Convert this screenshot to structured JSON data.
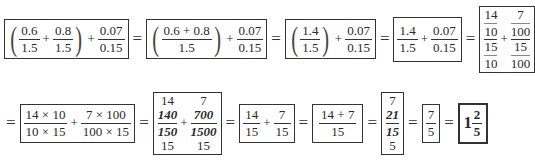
{
  "row1": {
    "step1": {
      "a_num": "0.6",
      "a_den": "1.5",
      "op1": "+",
      "b_num": "0.8",
      "b_den": "1.5",
      "op2": "+",
      "c_num": "0.07",
      "c_den": "0.15"
    },
    "eq1": "=",
    "step2": {
      "a_num": "0.6 + 0.8",
      "a_den": "1.5",
      "op": "+",
      "c_num": "0.07",
      "c_den": "0.15"
    },
    "eq2": "=",
    "step3": {
      "a_num": "1.4",
      "a_den": "1.5",
      "op": "+",
      "c_num": "0.07",
      "c_den": "0.15"
    },
    "eq3": "=",
    "step4": {
      "a_num": "1.4",
      "a_den": "1.5",
      "op": "+",
      "c_num": "0.07",
      "c_den": "0.15"
    },
    "eq4": "=",
    "step5": {
      "a_top": "14",
      "a_mid": "10",
      "a_low": "15",
      "a_bot": "10",
      "op": "+",
      "b_top": "7",
      "b_mid": "100",
      "b_low": "15",
      "b_bot": "100"
    }
  },
  "row2": {
    "eq0": "=",
    "step6": {
      "a_num": "14 × 10",
      "a_den": "10 × 15",
      "op": "+",
      "b_num": "7 × 100",
      "b_den": "100 × 15"
    },
    "eq1": "=",
    "step7": {
      "a_top": "14",
      "a_num": "140",
      "a_den": "150",
      "a_bot": "15",
      "op": "+",
      "b_top": "7",
      "b_num": "700",
      "b_den": "1500",
      "b_bot": "15"
    },
    "eq2": "=",
    "step8": {
      "a_num": "14",
      "a_den": "15",
      "op": "+",
      "b_num": "7",
      "b_den": "15"
    },
    "eq3": "=",
    "step9": {
      "num": "14 + 7",
      "den": "15"
    },
    "eq4": "=",
    "step10": {
      "top": "7",
      "num": "21",
      "den": "15",
      "bot": "5"
    },
    "eq5": "=",
    "step11": {
      "num": "7",
      "den": "5"
    },
    "eq6": "=",
    "answer": {
      "whole": "1",
      "num": "2",
      "den": "5"
    }
  }
}
